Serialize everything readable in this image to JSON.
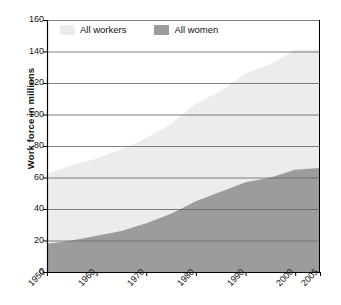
{
  "chart_data": {
    "type": "area",
    "title": "",
    "subtitle": "",
    "xlabel": "",
    "ylabel": "Work force in millions",
    "xlim": [
      1950,
      2005
    ],
    "ylim": [
      0,
      160
    ],
    "grid": true,
    "legend_position": "top-left-inside",
    "y_ticks": [
      0,
      20,
      40,
      60,
      80,
      100,
      120,
      140,
      160
    ],
    "x_ticks": [
      1950,
      1960,
      1970,
      1980,
      1990,
      2000,
      2005
    ],
    "x_tick_labels": [
      "1950",
      "1960",
      "1970",
      "1980",
      "1990",
      "2000",
      "2005"
    ],
    "y_tick_labels": [
      "0",
      "20",
      "40",
      "60",
      "80",
      "100",
      "120",
      "140",
      "160"
    ],
    "x": [
      1950,
      1955,
      1960,
      1965,
      1970,
      1975,
      1980,
      1985,
      1990,
      1995,
      2000,
      2005
    ],
    "series": [
      {
        "name": "All workers",
        "color": "#ececec",
        "values": [
          62,
          68,
          72,
          78,
          85,
          94,
          107,
          115,
          126,
          132,
          141,
          141
        ]
      },
      {
        "name": "All women",
        "color": "#9c9c9c",
        "values": [
          18,
          20,
          23,
          26,
          31,
          37,
          45,
          51,
          57,
          60,
          65,
          66
        ]
      }
    ],
    "annotations": []
  },
  "legend": {
    "items": [
      {
        "label": "All workers",
        "color": "#ececec"
      },
      {
        "label": "All women",
        "color": "#9c9c9c"
      }
    ]
  },
  "axes": {
    "y_label": "Work force in millions"
  }
}
